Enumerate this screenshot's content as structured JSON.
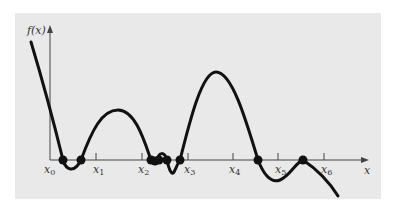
{
  "figure": {
    "y_axis_label": "f(x)",
    "x_axis_label": "x",
    "ticks": [
      {
        "name": "x",
        "sub": "0"
      },
      {
        "name": "x",
        "sub": "1"
      },
      {
        "name": "x",
        "sub": "2"
      },
      {
        "name": "x",
        "sub": "3"
      },
      {
        "name": "x",
        "sub": "4"
      },
      {
        "name": "x",
        "sub": "5"
      },
      {
        "name": "x",
        "sub": "6"
      }
    ],
    "root_count": 9,
    "colors": {
      "panel": "#e9e9e9",
      "curve": "#111111",
      "axis": "#444444"
    }
  }
}
